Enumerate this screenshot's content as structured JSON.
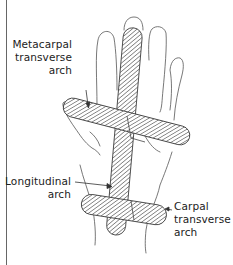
{
  "figure": {
    "colors": {
      "outline": "#555555",
      "hatch": "#444444",
      "text": "#222222"
    }
  },
  "labels": {
    "metacarpal": {
      "line1": "Metacarpal",
      "line2": "transverse",
      "line3": "arch"
    },
    "longitudinal": {
      "line1": "Longitudinal",
      "line2": "arch"
    },
    "carpal": {
      "line1": "Carpal",
      "line2": "transverse",
      "line3": "arch"
    }
  }
}
